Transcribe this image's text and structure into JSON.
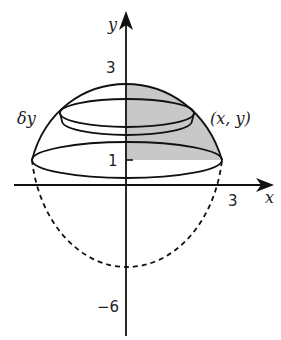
{
  "diagram": {
    "axes": {
      "x_label": "x",
      "y_label": "y"
    },
    "tick_labels": {
      "three_y": "3",
      "one_y": "1",
      "three_x": "3",
      "neg_six": "−6"
    },
    "annotations": {
      "delta_y": "δy",
      "point": "(x, y)"
    },
    "colors": {
      "stroke": "#111111",
      "shade": "#c8c8c8",
      "background": "#ffffff"
    }
  }
}
